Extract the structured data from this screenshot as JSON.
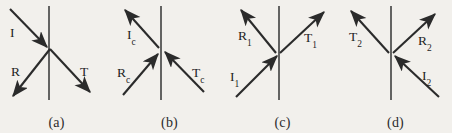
{
  "figure": {
    "background_color": "#f2f0ec",
    "stroke_color": "#2b2b2b",
    "panels": [
      {
        "id": "a",
        "caption": "(a)",
        "interface": "vertical-line",
        "arrows": [
          {
            "name": "incident",
            "label": "I",
            "sub": "",
            "direction": "inward",
            "from": "upper-left"
          },
          {
            "name": "reflected",
            "label": "R",
            "sub": "",
            "direction": "outward",
            "to": "lower-left"
          },
          {
            "name": "transmitted",
            "label": "T",
            "sub": "",
            "direction": "outward",
            "to": "lower-right"
          }
        ]
      },
      {
        "id": "b",
        "caption": "(b)",
        "interface": "vertical-line",
        "arrows": [
          {
            "name": "incident-conjugate",
            "label": "I",
            "sub": "c",
            "direction": "outward",
            "to": "upper-left"
          },
          {
            "name": "reflected-conjugate",
            "label": "R",
            "sub": "c",
            "direction": "inward",
            "from": "lower-left"
          },
          {
            "name": "transmitted-conjugate",
            "label": "T",
            "sub": "c",
            "direction": "inward",
            "from": "lower-right"
          }
        ]
      },
      {
        "id": "c",
        "caption": "(c)",
        "interface": "vertical-line",
        "arrows": [
          {
            "name": "incident-1",
            "label": "I",
            "sub": "1",
            "direction": "inward",
            "from": "lower-left"
          },
          {
            "name": "reflected-1",
            "label": "R",
            "sub": "1",
            "direction": "outward",
            "to": "upper-left"
          },
          {
            "name": "transmitted-1",
            "label": "T",
            "sub": "1",
            "direction": "outward",
            "to": "upper-right"
          }
        ]
      },
      {
        "id": "d",
        "caption": "(d)",
        "interface": "vertical-line",
        "arrows": [
          {
            "name": "incident-2",
            "label": "I",
            "sub": "2",
            "direction": "inward",
            "from": "lower-right"
          },
          {
            "name": "transmitted-2",
            "label": "T",
            "sub": "2",
            "direction": "outward",
            "to": "upper-left"
          },
          {
            "name": "reflected-2",
            "label": "R",
            "sub": "2",
            "direction": "outward",
            "to": "upper-right"
          }
        ]
      }
    ]
  },
  "labels": {
    "a": {
      "I": "I",
      "R": "R",
      "T": "T"
    },
    "b": {
      "I": "I",
      "Isub": "c",
      "R": "R",
      "Rsub": "c",
      "T": "T",
      "Tsub": "c"
    },
    "c": {
      "I": "I",
      "Isub": "1",
      "R": "R",
      "Rsub": "1",
      "T": "T",
      "Tsub": "1"
    },
    "d": {
      "I": "I",
      "Isub": "2",
      "R": "R",
      "Rsub": "2",
      "T": "T",
      "Tsub": "2"
    }
  },
  "captions": {
    "a": "(a)",
    "b": "(b)",
    "c": "(c)",
    "d": "(d)"
  }
}
